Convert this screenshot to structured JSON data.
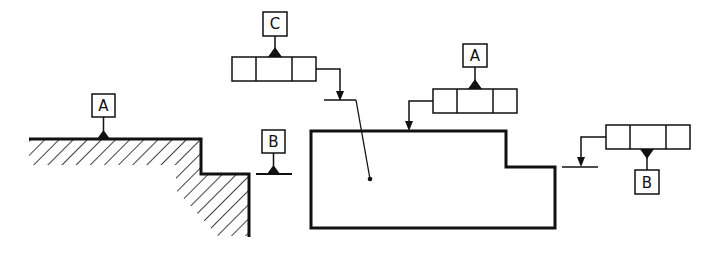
{
  "diagram": {
    "type": "gd&t-datum-and-tolerance-frame-illustration",
    "colors": {
      "stroke": "#111111",
      "background": "#ffffff"
    },
    "left_part": {
      "datum_labels": [
        "A",
        "B"
      ]
    },
    "frames": [
      {
        "id": "fcf-c",
        "datum_label": "C",
        "cells": 3,
        "datum_position": "above"
      },
      {
        "id": "fcf-a",
        "datum_label": "A",
        "cells": 3,
        "datum_position": "above"
      },
      {
        "id": "fcf-b",
        "datum_label": "B",
        "cells": 3,
        "datum_position": "below"
      }
    ],
    "labels": {
      "datum_a_left": "A",
      "datum_b_left": "B",
      "datum_c": "C",
      "datum_a_right": "A",
      "datum_b_right": "B"
    }
  }
}
